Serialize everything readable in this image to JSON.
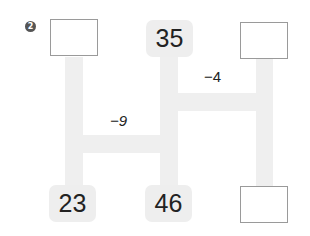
{
  "problem": {
    "number_badge": "2",
    "ladder": {
      "top": {
        "left_box": "",
        "middle_value": "35",
        "right_box": ""
      },
      "bottom": {
        "left_value": "23",
        "middle_value": "46",
        "right_box": ""
      },
      "operations": {
        "upper_rung": "−4",
        "lower_rung": "−9"
      }
    },
    "colors": {
      "ladder_bar": "#efefef",
      "number_tile": "#eeeeee",
      "box_border": "#9a9a9a",
      "badge": "#555555",
      "text": "#222222"
    }
  }
}
